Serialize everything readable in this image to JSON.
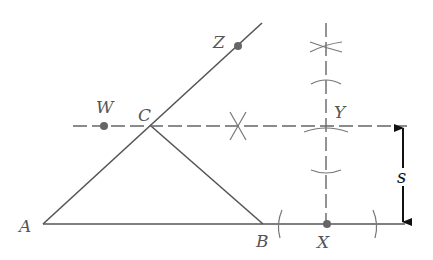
{
  "diagram": {
    "colors": {
      "line": "#555555",
      "point": "#666666",
      "arrow": "#111111"
    },
    "points": {
      "A": {
        "label": "A"
      },
      "B": {
        "label": "B"
      },
      "C": {
        "label": "C"
      },
      "W": {
        "label": "W"
      },
      "X": {
        "label": "X"
      },
      "Y": {
        "label": "Y"
      },
      "Z": {
        "label": "Z"
      }
    },
    "dimension": {
      "label": "s"
    }
  }
}
